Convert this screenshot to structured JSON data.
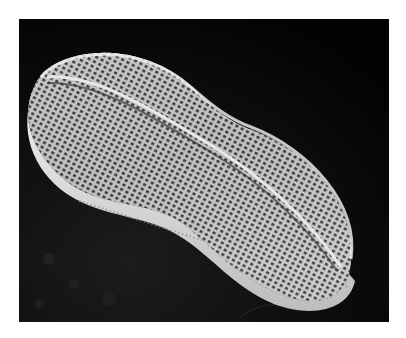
{
  "page": {
    "caption_fragment": ""
  },
  "figure": {
    "type": "scanning-electron-micrograph",
    "background_color": "#050505",
    "subject_color": "#d8d8d8"
  }
}
